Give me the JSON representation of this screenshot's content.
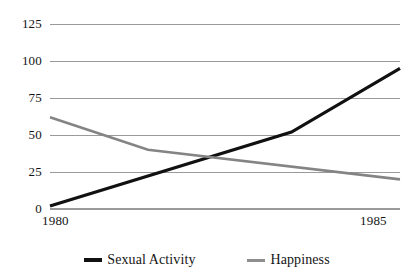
{
  "chart_data": {
    "type": "line",
    "title": "",
    "xlabel": "",
    "ylabel": "",
    "xlim": [
      1980,
      1985
    ],
    "ylim": [
      0,
      125
    ],
    "grid": true,
    "legend_position": "bottom",
    "y_ticks": [
      "125",
      "100",
      "75",
      "50",
      "25",
      "0"
    ],
    "y_tick_values": [
      125,
      100,
      75,
      50,
      25,
      0
    ],
    "x_ticks": [
      "1980",
      "1985"
    ],
    "x_tick_values": [
      1980,
      1985
    ],
    "series": [
      {
        "name": "Sexual Activity",
        "color": "#111111",
        "width": 3.2,
        "x": [
          1980,
          1983.45,
          1985
        ],
        "values": [
          2,
          52,
          95
        ]
      },
      {
        "name": "Happiness",
        "color": "#848484",
        "width": 2.6,
        "x": [
          1980,
          1981.4,
          1985
        ],
        "values": [
          62,
          40,
          20
        ]
      }
    ]
  },
  "axes": {
    "grid_color": "#9a9a9a",
    "background": "#ffffff",
    "plot_left": 50,
    "plot_right": 400,
    "plot_top": 24,
    "plot_bottom": 209
  },
  "legend": {
    "items": [
      {
        "label": "Sexual Activity",
        "color": "#111111"
      },
      {
        "label": "Happiness",
        "color": "#8e8e8e"
      }
    ]
  }
}
